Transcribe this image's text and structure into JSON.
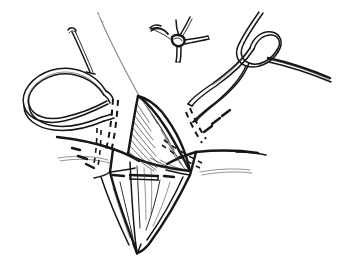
{
  "figure": {
    "background_color": "#ffffff",
    "ink_color": "#16161a",
    "width": 340,
    "height": 270,
    "style": "pen-and-ink medical illustration, no text labels"
  },
  "elements": {
    "knot_detail": {
      "name": "completed-suture-knot-inset",
      "description": "small tied knot with four radiating suture tails, upper center",
      "center": [
        176,
        38
      ],
      "tail_count": 4
    },
    "left_suture_loop": {
      "name": "left-suture-thread-loop",
      "description": "large open thread loop lying to the left of the wound, double-outline thread",
      "extent": [
        18,
        62,
        120,
        110
      ]
    },
    "right_suture_thread": {
      "name": "right-suture-thread-with-crossing",
      "description": "thread descending from upper right, crossing itself to form a half-hitch, tail exits right edge",
      "extent": [
        200,
        12,
        138,
        120
      ]
    },
    "direction_arrow": {
      "name": "direction-arrow-left",
      "description": "curved arrow in upper left indicating thread pull direction",
      "from": [
        72,
        30
      ],
      "to": [
        92,
        72
      ]
    },
    "guide_line": {
      "name": "needle-path-guide-line",
      "description": "fine straight line from top center down to the apex of the hatched flap",
      "from": [
        99,
        14
      ],
      "to": [
        140,
        97
      ]
    },
    "tissue_flap": {
      "name": "hatched-tissue-flap",
      "description": "central triangular flap of tissue rendered with fine diagonal hatching",
      "apex": [
        138,
        96
      ],
      "hatch_direction": "diagonal down-right"
    },
    "skin_surface": {
      "name": "skin-surface-line",
      "description": "horizontal wavy skin surface lines spanning left and right of the wound",
      "left_span": [
        48,
        148,
        120,
        18
      ],
      "right_span": [
        196,
        150,
        118,
        20
      ]
    },
    "wound_cavity": {
      "name": "deep-wound-cavity",
      "description": "V-shaped deep incision converging to a point at bottom center with irregular tissue strands",
      "apex": [
        137,
        252
      ]
    },
    "cross_suture_bar": {
      "name": "cross-suture-bar",
      "description": "short horizontal double-line suture bar crossing the wound at mid depth",
      "from": [
        131,
        176
      ],
      "to": [
        157,
        176
      ]
    },
    "hidden_suture_paths": {
      "name": "hidden-suture-dashed-paths",
      "description": "dashed segments showing suture passing beneath the tissue on both wound edges",
      "count": 6
    }
  },
  "colors": {
    "ink": "#16161a",
    "hatch": "#2a2a30",
    "hairline": "#3a3a40",
    "paper": "#ffffff"
  }
}
